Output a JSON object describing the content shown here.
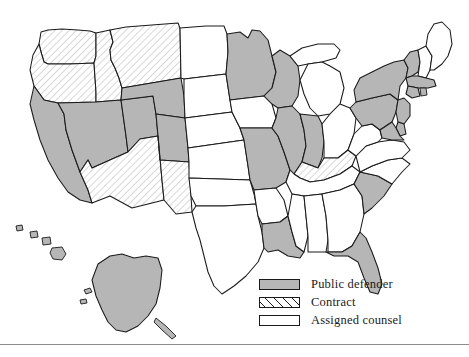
{
  "figure": {
    "rule_color": "#8a8a8a"
  },
  "legend": {
    "items": [
      {
        "key": "public_defender",
        "label": "Public defender",
        "pattern": "solid-gray",
        "color": "#b6b6b6"
      },
      {
        "key": "contract",
        "label": "Contract",
        "pattern": "diagonal-hatch",
        "color": "#ffffff"
      },
      {
        "key": "assigned_counsel",
        "label": "Assigned counsel",
        "pattern": "solid-white",
        "color": "#ffffff"
      }
    ]
  },
  "map_data": {
    "type": "choropleth",
    "region": "United States",
    "categories": [
      "Public defender",
      "Contract",
      "Assigned counsel"
    ],
    "colors": {
      "Public defender": "#b6b6b6",
      "Contract": "#ffffff",
      "Assigned counsel": "#ffffff"
    },
    "states": [
      {
        "code": "WA",
        "name": "Washington",
        "category": "Contract"
      },
      {
        "code": "OR",
        "name": "Oregon",
        "category": "Contract"
      },
      {
        "code": "ID",
        "name": "Idaho",
        "category": "Contract"
      },
      {
        "code": "MT",
        "name": "Montana",
        "category": "Contract"
      },
      {
        "code": "WY",
        "name": "Wyoming",
        "category": "Public defender"
      },
      {
        "code": "CA",
        "name": "California",
        "category": "Public defender"
      },
      {
        "code": "NV",
        "name": "Nevada",
        "category": "Public defender"
      },
      {
        "code": "UT",
        "name": "Utah",
        "category": "Public defender"
      },
      {
        "code": "AZ",
        "name": "Arizona",
        "category": "Contract"
      },
      {
        "code": "NM",
        "name": "New Mexico",
        "category": "Contract"
      },
      {
        "code": "CO",
        "name": "Colorado",
        "category": "Public defender"
      },
      {
        "code": "ND",
        "name": "North Dakota",
        "category": "Assigned counsel"
      },
      {
        "code": "SD",
        "name": "South Dakota",
        "category": "Assigned counsel"
      },
      {
        "code": "NE",
        "name": "Nebraska",
        "category": "Assigned counsel"
      },
      {
        "code": "KS",
        "name": "Kansas",
        "category": "Assigned counsel"
      },
      {
        "code": "OK",
        "name": "Oklahoma",
        "category": "Assigned counsel"
      },
      {
        "code": "TX",
        "name": "Texas",
        "category": "Assigned counsel"
      },
      {
        "code": "MN",
        "name": "Minnesota",
        "category": "Public defender"
      },
      {
        "code": "IA",
        "name": "Iowa",
        "category": "Assigned counsel"
      },
      {
        "code": "MO",
        "name": "Missouri",
        "category": "Public defender"
      },
      {
        "code": "AR",
        "name": "Arkansas",
        "category": "Assigned counsel"
      },
      {
        "code": "LA",
        "name": "Louisiana",
        "category": "Public defender"
      },
      {
        "code": "WI",
        "name": "Wisconsin",
        "category": "Public defender"
      },
      {
        "code": "IL",
        "name": "Illinois",
        "category": "Public defender"
      },
      {
        "code": "MI",
        "name": "Michigan",
        "category": "Assigned counsel"
      },
      {
        "code": "IN",
        "name": "Indiana",
        "category": "Public defender"
      },
      {
        "code": "OH",
        "name": "Ohio",
        "category": "Assigned counsel"
      },
      {
        "code": "KY",
        "name": "Kentucky",
        "category": "Contract"
      },
      {
        "code": "TN",
        "name": "Tennessee",
        "category": "Assigned counsel"
      },
      {
        "code": "MS",
        "name": "Mississippi",
        "category": "Assigned counsel"
      },
      {
        "code": "AL",
        "name": "Alabama",
        "category": "Assigned counsel"
      },
      {
        "code": "GA",
        "name": "Georgia",
        "category": "Assigned counsel"
      },
      {
        "code": "FL",
        "name": "Florida",
        "category": "Public defender"
      },
      {
        "code": "SC",
        "name": "South Carolina",
        "category": "Public defender"
      },
      {
        "code": "NC",
        "name": "North Carolina",
        "category": "Assigned counsel"
      },
      {
        "code": "VA",
        "name": "Virginia",
        "category": "Assigned counsel"
      },
      {
        "code": "WV",
        "name": "West Virginia",
        "category": "Assigned counsel"
      },
      {
        "code": "MD",
        "name": "Maryland",
        "category": "Public defender"
      },
      {
        "code": "DE",
        "name": "Delaware",
        "category": "Public defender"
      },
      {
        "code": "NJ",
        "name": "New Jersey",
        "category": "Public defender"
      },
      {
        "code": "PA",
        "name": "Pennsylvania",
        "category": "Public defender"
      },
      {
        "code": "NY",
        "name": "New York",
        "category": "Public defender"
      },
      {
        "code": "VT",
        "name": "Vermont",
        "category": "Public defender"
      },
      {
        "code": "NH",
        "name": "New Hampshire",
        "category": "Assigned counsel"
      },
      {
        "code": "ME",
        "name": "Maine",
        "category": "Assigned counsel"
      },
      {
        "code": "MA",
        "name": "Massachusetts",
        "category": "Public defender"
      },
      {
        "code": "CT",
        "name": "Connecticut",
        "category": "Public defender"
      },
      {
        "code": "RI",
        "name": "Rhode Island",
        "category": "Public defender"
      },
      {
        "code": "AK",
        "name": "Alaska",
        "category": "Public defender"
      },
      {
        "code": "HI",
        "name": "Hawaii",
        "category": "Public defender"
      }
    ]
  }
}
